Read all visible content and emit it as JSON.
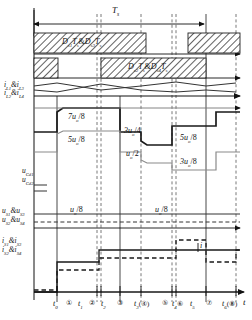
{
  "figure": {
    "type": "timing-waveform-diagram",
    "time_axis_label": "t",
    "period_label": "T",
    "period_label_sub": "s"
  },
  "gate_blocks": {
    "row1_label": "D",
    "row1_text": "Ds1Ts&Ds3Ts",
    "row2_text": "Ds2Ts&Ds4Ts",
    "row1_parts": {
      "a": "D",
      "a_sub": "s1",
      "b": "T",
      "b_sub": "s",
      "amp": "&",
      "c": "D",
      "c_sub": "s3",
      "d": "T",
      "d_sub": "s"
    },
    "row2_parts": {
      "a": "D",
      "a_sub": "s2",
      "b": "T",
      "b_sub": "s",
      "amp": "&",
      "c": "D",
      "c_sub": "s4",
      "d": "T",
      "d_sub": "s"
    }
  },
  "inductor_currents": {
    "label1": "i",
    "label1_sub1": "L1",
    "label1_amp": "&i",
    "label1_sub2": "L3",
    "label2": "i",
    "label2_sub1": "L2",
    "label2_amp": "&i",
    "label2_sub2": "L4"
  },
  "cap_voltages": {
    "label1": "u",
    "label1_sub": "Cd1",
    "label2": "u",
    "label2_sub": "Cd2"
  },
  "switch_voltages": {
    "label1": "u",
    "label1_sub1": "S1",
    "label1_amp": "&u",
    "label1_sub2": "S3",
    "label2": "u",
    "label2_sub1": "S2",
    "label2_amp": "&u",
    "label2_sub2": "S4",
    "level_a": "u",
    "level_a_sub": "o",
    "level_a_den": "/8",
    "level_b": "u",
    "level_b_sub": "o",
    "level_b_den": "/8"
  },
  "switch_currents": {
    "label1": "i",
    "label1_sub1": "S1",
    "label1_amp": "&i",
    "label1_sub2": "S3",
    "label2": "i",
    "label2_sub1": "S2",
    "label2_amp": "&i",
    "label2_sub2": "S4",
    "marker": "i"
  },
  "voltage_levels": [
    {
      "id": "lv-7uo8",
      "num": "7u",
      "sub": "o",
      "den": "/8"
    },
    {
      "id": "lv-5uo8a",
      "num": "5u",
      "sub": "o",
      "den": "/8"
    },
    {
      "id": "lv-3uo4",
      "num": "3u",
      "sub": "o",
      "den": "/4"
    },
    {
      "id": "lv-uo2",
      "num": "u",
      "sub": "o",
      "den": "/2"
    },
    {
      "id": "lv-5uo8b",
      "num": "5u",
      "sub": "o",
      "den": "/8"
    },
    {
      "id": "lv-3uo8",
      "num": "3u",
      "sub": "o",
      "den": "/8"
    }
  ],
  "time_ticks": [
    {
      "id": "t0",
      "text": "t",
      "sub": "0",
      "circ": ""
    },
    {
      "id": "c1",
      "text": "",
      "sub": "",
      "circ": "①"
    },
    {
      "id": "t1",
      "text": "t",
      "sub": "1",
      "circ": ""
    },
    {
      "id": "c2",
      "text": "",
      "sub": "",
      "circ": "②"
    },
    {
      "id": "t2",
      "text": "t",
      "sub": "2",
      "circ": ""
    },
    {
      "id": "c3",
      "text": "",
      "sub": "",
      "circ": "③"
    },
    {
      "id": "t3",
      "text": "t",
      "sub": "3",
      "circ": "(④)"
    },
    {
      "id": "c5",
      "text": "",
      "sub": "",
      "circ": "⑤"
    },
    {
      "id": "t4",
      "text": "t",
      "sub": "4",
      "circ": "⑥"
    },
    {
      "id": "t5",
      "text": "t",
      "sub": "5",
      "circ": ""
    },
    {
      "id": "c7",
      "text": "",
      "sub": "",
      "circ": "⑦"
    },
    {
      "id": "t6",
      "text": "t",
      "sub": "6",
      "circ": "(⑧)"
    }
  ],
  "colors": {
    "ink": "#111111",
    "grid": "#6b6b6b",
    "hatch": "#3a3a3a",
    "light": "#8a8a8a"
  }
}
